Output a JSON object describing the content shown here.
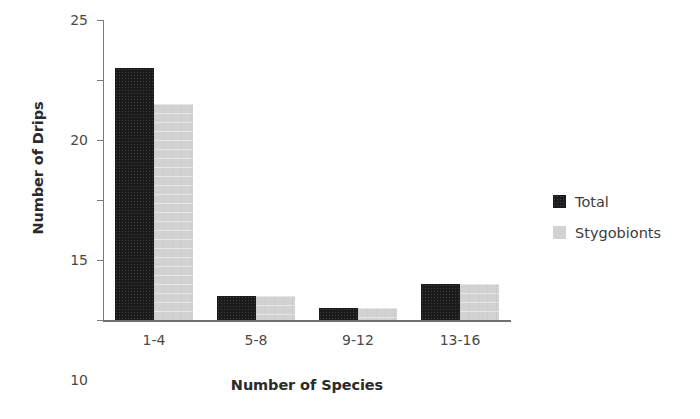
{
  "chart_data": {
    "type": "bar",
    "title": "",
    "xlabel": "Number of Species",
    "ylabel": "Number of Drips",
    "categories": [
      "1-4",
      "5-8",
      "9-12",
      "13-16"
    ],
    "series": [
      {
        "name": "Total",
        "color": "#1b1b1b",
        "values": [
          21,
          2,
          1,
          3
        ]
      },
      {
        "name": "Stygobionts",
        "color": "#d2d2d2",
        "values": [
          18,
          2,
          1,
          3
        ]
      }
    ],
    "ylim": [
      0,
      25
    ],
    "yticks": [
      0,
      5,
      10,
      15,
      20,
      25
    ],
    "ytick_labels": [
      "0",
      "5",
      "10",
      "15",
      "20",
      "25"
    ],
    "grid": false,
    "legend_position": "right"
  }
}
